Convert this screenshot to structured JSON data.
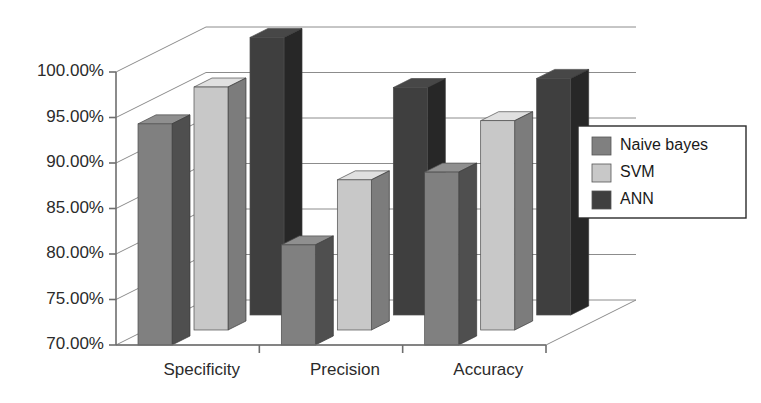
{
  "chart_data": {
    "type": "bar",
    "title": "",
    "subtitle": "",
    "xlabel": "",
    "ylabel": "",
    "categories": [
      "Specificity",
      "Precision",
      "Accuracy"
    ],
    "series": [
      {
        "name": "Naive bayes",
        "color": "#808080",
        "values": [
          94.3,
          81.0,
          89.0
        ]
      },
      {
        "name": "SVM",
        "color": "#c8c8c8",
        "values": [
          96.7,
          86.5,
          93.0
        ]
      },
      {
        "name": "ANN",
        "color": "#3f3f3f",
        "values": [
          100.5,
          95.0,
          96.0
        ]
      }
    ],
    "ylim": [
      70,
      100
    ],
    "ytick_step": 5,
    "ytick_labels": [
      "100.00%",
      "95.00%",
      "90.00%",
      "85.00%",
      "80.00%",
      "75.00%",
      "70.00%"
    ],
    "ytick_values": [
      100,
      95,
      90,
      85,
      80,
      75,
      70
    ],
    "grid": true,
    "projection": "3d-columns",
    "legend_position": "right",
    "legend_entries": [
      "Naive bayes",
      "SVM",
      "ANN"
    ]
  },
  "legend": {
    "items": [
      {
        "label": "Naive bayes",
        "swatch": "#808080"
      },
      {
        "label": "SVM",
        "swatch": "#c8c8c8"
      },
      {
        "label": "ANN",
        "swatch": "#3f3f3f"
      }
    ]
  },
  "axis": {
    "y_labels": [
      "100.00%",
      "95.00%",
      "90.00%",
      "85.00%",
      "80.00%",
      "75.00%",
      "70.00%"
    ],
    "x_labels": [
      "Specificity",
      "Precision",
      "Accuracy"
    ]
  }
}
